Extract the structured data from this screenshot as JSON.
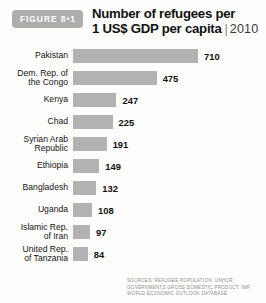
{
  "figure": {
    "badge_label": "FIGURE 8•1",
    "title_line1": "Number of refugees per",
    "title_line2": "1 US$ GDP per capita",
    "title_separator": "|",
    "year": "2010"
  },
  "source": {
    "line1": "SOURCES: REFUGEE POPULATION: UNHCR;",
    "line2": "GOVERNMENTS GROSS DOMESTIC PRODUCT: IMF,",
    "line3": "WORLD ECONOMIC OUTLOOK DATABASE"
  },
  "colors": {
    "bar_fill": "#b2b2b2",
    "badge_bg": "#adadad",
    "background": "#fdfdfc",
    "text": "#111111",
    "source_text": "#8d8d8d"
  },
  "chart_data": {
    "type": "bar",
    "orientation": "horizontal",
    "title": "Number of refugees per 1 US$ GDP per capita",
    "subtitle": "2010",
    "xlabel": "",
    "ylabel": "",
    "grid": false,
    "legend": false,
    "xlim": [
      0,
      710
    ],
    "categories": [
      "Pakistan",
      "Dem. Rep. of\nthe Congo",
      "Kenya",
      "Chad",
      "Syrian Arab\nRepublic",
      "Ethiopia",
      "Bangladesh",
      "Uganda",
      "Islamic Rep.\nof Iran",
      "United Rep.\nof Tanzania"
    ],
    "values": [
      710,
      475,
      247,
      225,
      191,
      149,
      132,
      108,
      97,
      84
    ],
    "value_labels": [
      "710",
      "475",
      "247",
      "225",
      "191",
      "149",
      "132",
      "108",
      "97",
      "84"
    ]
  }
}
